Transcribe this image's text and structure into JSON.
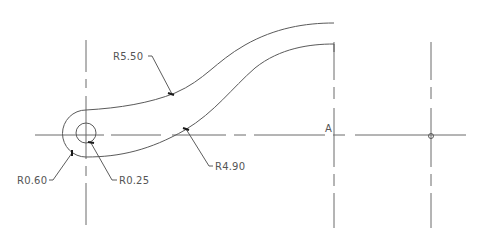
{
  "drawing": {
    "background": "#ffffff",
    "line_color": "#5a5a5a",
    "dimensions": {
      "r_outer_upper": "R5.50",
      "r_inner_lower": "R4.90",
      "r_boss": "R0.60",
      "r_hole": "R0.25"
    },
    "point_label": "A"
  }
}
